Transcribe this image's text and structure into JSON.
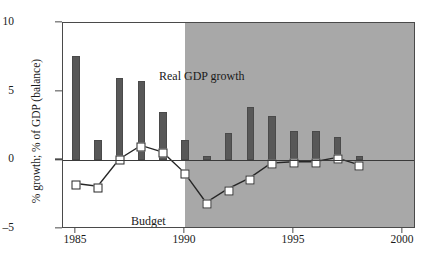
{
  "chart_data": {
    "type": "bar",
    "title": "",
    "subtitle": "",
    "xlabel": "",
    "ylabel": "% growth; % of GDP (balance)",
    "ylim": [
      -5,
      10
    ],
    "xlim": [
      1984.4,
      2000.6
    ],
    "yticks": [
      "10",
      "5",
      "0",
      "-5"
    ],
    "ytick_values": [
      10,
      5,
      0,
      -5
    ],
    "xticks": [
      "1985",
      "1990",
      "1995",
      "2000"
    ],
    "xtick_values": [
      1985,
      1990,
      1995,
      2000
    ],
    "grid": false,
    "legend_position": "in-plot annotations",
    "categories": [
      1985,
      1986,
      1987,
      1988,
      1989,
      1990,
      1991,
      1992,
      1993,
      1994,
      1995,
      1996,
      1997,
      1998
    ],
    "series": [
      {
        "name": "Real GDP growth",
        "type": "bar",
        "color": "#585858",
        "values": [
          7.6,
          1.5,
          6.0,
          5.8,
          3.5,
          1.5,
          0.3,
          2.0,
          3.9,
          3.2,
          2.1,
          2.1,
          1.7,
          0.3
        ]
      },
      {
        "name": "Budget balance",
        "type": "line",
        "marker": "white-square",
        "color": "#262626",
        "values": [
          -1.8,
          -2.0,
          0.0,
          1.0,
          0.5,
          -1.0,
          -3.2,
          -2.2,
          -1.4,
          -0.3,
          -0.2,
          -0.2,
          0.1,
          -0.4
        ]
      }
    ],
    "annotations": [
      {
        "name": "gdp-annotation",
        "text": "Real GDP growth",
        "x": 1986.3,
        "y": 8.5
      },
      {
        "name": "budget-annotation",
        "line1": "Budget",
        "line2": "balance",
        "x": 1985.3,
        "y": -3.4
      }
    ],
    "shaded_region": {
      "label": "forecast",
      "from": 1990,
      "to": 2000.6,
      "color": "#a8a8a8"
    }
  },
  "annotations": {
    "gdp_growth_label": "Real GDP growth",
    "budget_label_line1": "Budget",
    "budget_label_line2": "balance"
  },
  "axes": {
    "y_title": "% growth; % of GDP (balance)"
  },
  "colors": {
    "bar": "#585858",
    "shade": "#a8a8a8",
    "line": "#262626",
    "marker_fill": "#ffffff",
    "frame": "#4a4a4a"
  }
}
